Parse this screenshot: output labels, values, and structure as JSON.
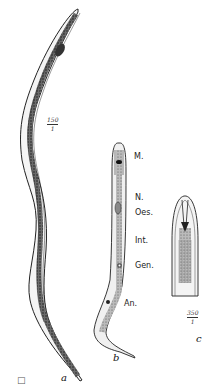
{
  "figure": {
    "panels": [
      {
        "id": "a",
        "label": "a",
        "scale": {
          "numerator": "150",
          "denominator": "1"
        }
      },
      {
        "id": "b",
        "label": "b",
        "anatomy_labels": [
          "M.",
          "N.",
          "Oes.",
          "Int.",
          "Gen.",
          "An."
        ]
      },
      {
        "id": "c",
        "label": "c",
        "scale": {
          "numerator": "350",
          "denominator": "1"
        }
      }
    ],
    "corner_mark": "□"
  }
}
